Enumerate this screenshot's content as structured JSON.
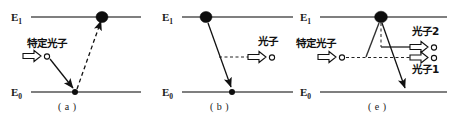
{
  "figure": {
    "width": 455,
    "height": 120,
    "background_color": "#ffffff",
    "line_color": "#555555",
    "ink_color": "#111111"
  },
  "panels": [
    {
      "id": "a",
      "caption": "( a )",
      "upper_level_label": "E",
      "upper_level_sub": "1",
      "lower_level_label": "E",
      "lower_level_sub": "0",
      "incoming_photon_label": "特定光子",
      "electrons": [
        "upper-level-electron",
        "lower-level-electron"
      ],
      "transitions": [
        "solid-downward-arrow",
        "dashed-upward-arrow"
      ]
    },
    {
      "id": "b",
      "caption": "( b )",
      "upper_level_label": "E",
      "upper_level_sub": "1",
      "lower_level_label": "E",
      "lower_level_sub": "0",
      "emitted_photon_label": "光子",
      "electrons": [
        "upper-level-electron",
        "lower-level-electron"
      ],
      "transitions": [
        "solid-downward-arrow",
        "dashed-horizontal-photon-path"
      ]
    },
    {
      "id": "c",
      "caption": "( e )",
      "upper_level_label": "E",
      "upper_level_sub": "1",
      "lower_level_label": "E",
      "lower_level_sub": "0",
      "incoming_photon_label": "特定光子",
      "emitted_photon_label_top": "光子2",
      "emitted_photon_label_bottom": "光子1",
      "electrons": [
        "upper-level-electron"
      ],
      "transitions": [
        "thin-upward-line",
        "vertical-dashed-line",
        "solid-downward-arrow",
        "solid-horizontal-photon-path",
        "dashed-horizontal-photon-path"
      ]
    }
  ],
  "icons": {
    "photon_arrow": "block-arrow-right-icon",
    "photon_quantum": "open-circle-icon",
    "electron": "filled-circle-icon"
  }
}
